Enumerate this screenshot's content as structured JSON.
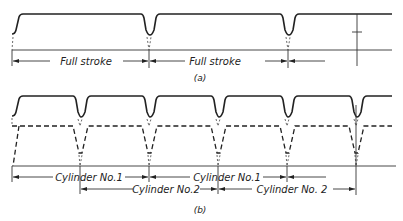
{
  "figure": {
    "panel_a": {
      "caption": "(a)",
      "dimensions": [
        {
          "label": "Full stroke",
          "from_x": 12,
          "to_x": 149
        },
        {
          "label": "Full stroke",
          "from_x": 149,
          "to_x": 288
        }
      ],
      "dip_positions_x": [
        149,
        288
      ],
      "height_marker": "T"
    },
    "panel_b": {
      "caption": "(b)",
      "dimensions_row1": [
        {
          "label": "Cylinder No.1",
          "from_x": 12,
          "to_x": 149
        },
        {
          "label": "Cylinder No.1",
          "from_x": 149,
          "to_x": 287
        }
      ],
      "dimensions_row2": [
        {
          "label": "Cylinder No.2",
          "from_x": 80,
          "to_x": 218
        },
        {
          "label": "Cylinder No. 2",
          "from_x": 218,
          "to_x": 356
        }
      ],
      "solid_dip_positions_x": [
        80,
        149,
        218,
        287,
        356
      ],
      "dashed_dip_positions_x": [
        80,
        149,
        218,
        287,
        356
      ]
    }
  }
}
